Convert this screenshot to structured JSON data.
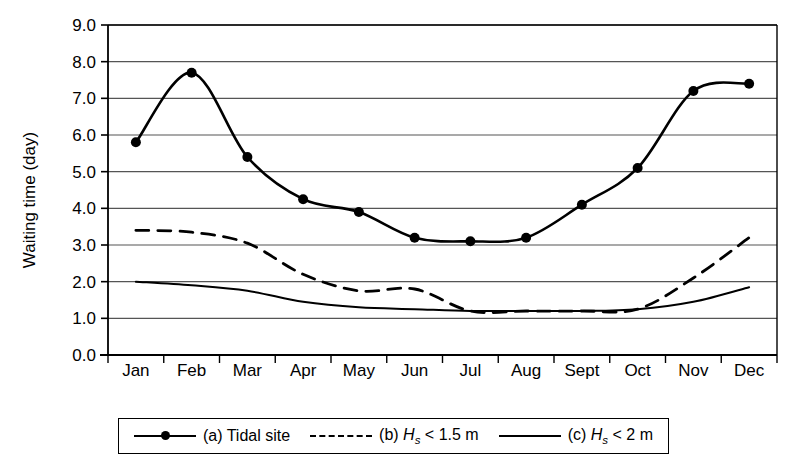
{
  "chart_data": {
    "type": "line",
    "title": "",
    "xlabel": "",
    "ylabel": "Waiting time (day)",
    "categories": [
      "Jan",
      "Feb",
      "Mar",
      "Apr",
      "May",
      "Jun",
      "Jul",
      "Aug",
      "Sept",
      "Oct",
      "Nov",
      "Dec"
    ],
    "ylim": [
      0.0,
      9.0
    ],
    "ytick_labels": [
      "0.0",
      "1.0",
      "2.0",
      "3.0",
      "4.0",
      "5.0",
      "6.0",
      "7.0",
      "8.0",
      "9.0"
    ],
    "ytick_values": [
      0.0,
      1.0,
      2.0,
      3.0,
      4.0,
      5.0,
      6.0,
      7.0,
      8.0,
      9.0
    ],
    "grid": "horizontal",
    "legend_position": "below-axes",
    "series": [
      {
        "name": "(a) Tidal site",
        "key": "a",
        "style": "solid-with-markers",
        "markers": true,
        "values": [
          5.8,
          7.7,
          5.4,
          4.25,
          3.9,
          3.2,
          3.1,
          3.2,
          4.1,
          5.1,
          7.2,
          7.4
        ]
      },
      {
        "name": "(b) Hs < 1.5 m",
        "key": "b",
        "style": "dashed",
        "markers": false,
        "values": [
          3.4,
          3.35,
          3.05,
          2.2,
          1.75,
          1.8,
          1.2,
          1.2,
          1.2,
          1.25,
          2.1,
          3.2
        ]
      },
      {
        "name": "(c) Hs < 2 m",
        "key": "c",
        "style": "solid",
        "markers": false,
        "values": [
          2.0,
          1.9,
          1.75,
          1.45,
          1.3,
          1.25,
          1.2,
          1.2,
          1.2,
          1.25,
          1.45,
          1.85
        ]
      }
    ]
  },
  "axis": {
    "y_title": "Waiting time (day)"
  },
  "legend": {
    "items": [
      {
        "id": "a",
        "prefix": "(a) Tidal site",
        "symbol": "H",
        "sub": "",
        "cmp": "",
        "unit": ""
      },
      {
        "id": "b",
        "prefix": "(b) ",
        "symbol": "H",
        "sub": "s",
        "cmp": " < 1.5",
        "unit": " m"
      },
      {
        "id": "c",
        "prefix": "(c) ",
        "symbol": "H",
        "sub": "s",
        "cmp": " < 2",
        "unit": " m"
      }
    ]
  },
  "colors": {
    "line": "#000000",
    "grid": "#555555",
    "axis": "#000000",
    "background": "#ffffff"
  }
}
